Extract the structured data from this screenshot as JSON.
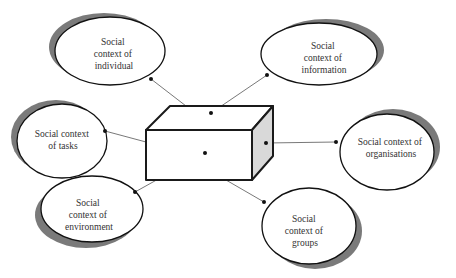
{
  "diagram": {
    "type": "hub-and-spoke",
    "center": {
      "label": "",
      "shape": "3d-box",
      "colors": {
        "front": "#ffffff",
        "top": "#ffffff",
        "side": "#d9d9d9",
        "stroke": "#1a1a1a"
      }
    },
    "nodes": [
      {
        "id": "individual",
        "lines": [
          "Social",
          "context of",
          "individual"
        ]
      },
      {
        "id": "information",
        "lines": [
          "Social",
          "context of",
          "information"
        ]
      },
      {
        "id": "tasks",
        "lines": [
          "Social context",
          "of tasks"
        ]
      },
      {
        "id": "organisations",
        "lines": [
          "Social context of",
          "organisations"
        ]
      },
      {
        "id": "environment",
        "lines": [
          "Social",
          "context of",
          "environment"
        ]
      },
      {
        "id": "groups",
        "lines": [
          "Social",
          "context of",
          "groups"
        ]
      }
    ],
    "edges": [
      {
        "from": "center",
        "to": "individual"
      },
      {
        "from": "center",
        "to": "information"
      },
      {
        "from": "center",
        "to": "tasks"
      },
      {
        "from": "center",
        "to": "organisations"
      },
      {
        "from": "center",
        "to": "environment"
      },
      {
        "from": "center",
        "to": "groups"
      }
    ],
    "colors": {
      "ellipse_fill": "#ffffff",
      "ellipse_stroke": "#111111",
      "shadow": "#7a7a7a",
      "connector": "#555555"
    }
  }
}
